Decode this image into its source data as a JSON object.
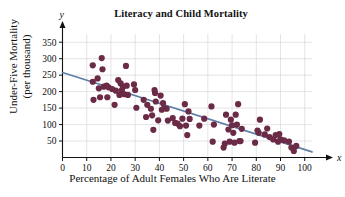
{
  "chart_data": {
    "type": "scatter",
    "title": "Literacy and Child Mortality",
    "xlabel": "Percentage of Adult Females Who Are Literate",
    "ylabel_line1": "Under-Five Mortality",
    "ylabel_line2": "(per thousand)",
    "x_axis_variable": "x",
    "y_axis_variable": "y",
    "xlim": [
      0,
      103
    ],
    "ylim": [
      0,
      375
    ],
    "xticks": [
      0,
      10,
      20,
      30,
      40,
      50,
      60,
      70,
      80,
      90,
      100
    ],
    "yticks": [
      50,
      100,
      150,
      200,
      250,
      300,
      350
    ],
    "grid": true,
    "grid_color": "#d8d8dc",
    "marker_color": "#6b2a46",
    "marker_size": 3.1,
    "trendline": {
      "color": "#5f7fa6",
      "width": 1.7,
      "x_start": 0,
      "y_start": 258,
      "x_end": 103,
      "y_end": 17,
      "slope": -2.34,
      "intercept": 258
    },
    "points": [
      [
        12.5,
        280
      ],
      [
        12.5,
        230
      ],
      [
        12.8,
        175
      ],
      [
        14.5,
        240
      ],
      [
        15.0,
        210
      ],
      [
        15.5,
        183
      ],
      [
        16.2,
        302
      ],
      [
        16.5,
        268
      ],
      [
        17.0,
        215
      ],
      [
        18.2,
        218
      ],
      [
        18.5,
        183
      ],
      [
        19.0,
        213
      ],
      [
        20.5,
        208
      ],
      [
        21.5,
        160
      ],
      [
        22.0,
        203
      ],
      [
        23.0,
        235
      ],
      [
        23.5,
        190
      ],
      [
        24.0,
        225
      ],
      [
        24.5,
        205
      ],
      [
        25.0,
        215
      ],
      [
        25.5,
        192
      ],
      [
        26.2,
        278
      ],
      [
        26.5,
        218
      ],
      [
        27.0,
        190
      ],
      [
        29.5,
        222
      ],
      [
        30.0,
        205
      ],
      [
        30.5,
        151
      ],
      [
        33.5,
        175
      ],
      [
        34.5,
        123
      ],
      [
        35.0,
        160
      ],
      [
        36.5,
        148
      ],
      [
        37.0,
        128
      ],
      [
        37.5,
        84
      ],
      [
        38.0,
        205
      ],
      [
        38.2,
        196
      ],
      [
        38.5,
        170
      ],
      [
        39.5,
        113
      ],
      [
        40.5,
        188
      ],
      [
        41.0,
        145
      ],
      [
        41.5,
        165
      ],
      [
        42.0,
        150
      ],
      [
        43.0,
        148
      ],
      [
        43.5,
        112
      ],
      [
        45.5,
        120
      ],
      [
        46.5,
        105
      ],
      [
        47.5,
        103
      ],
      [
        48.5,
        95
      ],
      [
        49.5,
        118
      ],
      [
        50.5,
        162
      ],
      [
        51.0,
        97
      ],
      [
        51.5,
        68
      ],
      [
        52.0,
        140
      ],
      [
        52.5,
        117
      ],
      [
        56.5,
        97
      ],
      [
        58.5,
        118
      ],
      [
        61.5,
        155
      ],
      [
        62.0,
        48
      ],
      [
        62.5,
        100
      ],
      [
        66.5,
        30
      ],
      [
        67.0,
        42
      ],
      [
        67.5,
        130
      ],
      [
        68.5,
        85
      ],
      [
        69.0,
        48
      ],
      [
        69.5,
        115
      ],
      [
        70.0,
        98
      ],
      [
        70.5,
        75
      ],
      [
        71.0,
        45
      ],
      [
        71.5,
        130
      ],
      [
        72.0,
        100
      ],
      [
        72.5,
        162
      ],
      [
        73.0,
        50
      ],
      [
        73.5,
        50
      ],
      [
        74.0,
        87
      ],
      [
        79.5,
        45
      ],
      [
        80.5,
        82
      ],
      [
        81.0,
        75
      ],
      [
        81.5,
        115
      ],
      [
        83.5,
        70
      ],
      [
        84.5,
        88
      ],
      [
        85.5,
        62
      ],
      [
        87.0,
        55
      ],
      [
        88.0,
        68
      ],
      [
        89.0,
        48
      ],
      [
        89.5,
        71
      ],
      [
        90.0,
        55
      ],
      [
        91.5,
        52
      ],
      [
        93.5,
        48
      ],
      [
        94.5,
        30
      ],
      [
        95.5,
        20
      ],
      [
        96.5,
        35
      ]
    ]
  }
}
